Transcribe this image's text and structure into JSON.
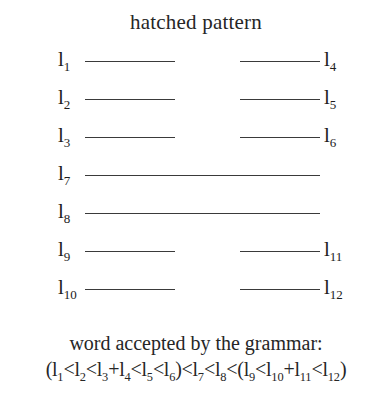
{
  "figure": {
    "title": "hatched pattern",
    "rows": [
      {
        "left_label": "l",
        "left_sub": "1",
        "right_label": "l",
        "right_sub": "4",
        "line": "split"
      },
      {
        "left_label": "l",
        "left_sub": "2",
        "right_label": "l",
        "right_sub": "5",
        "line": "split"
      },
      {
        "left_label": "l",
        "left_sub": "3",
        "right_label": "l",
        "right_sub": "6",
        "line": "split"
      },
      {
        "left_label": "l",
        "left_sub": "7",
        "right_label": "",
        "right_sub": "",
        "line": "full"
      },
      {
        "left_label": "l",
        "left_sub": "8",
        "right_label": "",
        "right_sub": "",
        "line": "full"
      },
      {
        "left_label": "l",
        "left_sub": "9",
        "right_label": "l",
        "right_sub": "11",
        "line": "split"
      },
      {
        "left_label": "l",
        "left_sub": "10",
        "right_label": "l",
        "right_sub": "12",
        "line": "split"
      }
    ],
    "caption": {
      "line1": "word accepted by the grammar:",
      "formula_tokens": [
        {
          "t": "(l",
          "sub": "1"
        },
        {
          "t": "<l",
          "sub": "2"
        },
        {
          "t": "<l",
          "sub": "3"
        },
        {
          "t": "+l",
          "sub": "4"
        },
        {
          "t": "<l",
          "sub": "5"
        },
        {
          "t": "<l",
          "sub": "6"
        },
        {
          "t": ")<l",
          "sub": "7"
        },
        {
          "t": "<l",
          "sub": "8"
        },
        {
          "t": "<(l",
          "sub": "9"
        },
        {
          "t": "<l",
          "sub": "10"
        },
        {
          "t": "+l",
          "sub": "11"
        },
        {
          "t": "<l",
          "sub": "12"
        },
        {
          "t": ")",
          "sub": ""
        }
      ]
    },
    "colors": {
      "background": "#ffffff",
      "text": "#262626",
      "line": "#3a3a3a"
    }
  }
}
